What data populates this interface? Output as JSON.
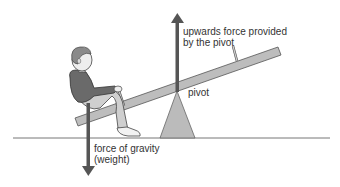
{
  "diagram": {
    "labels": {
      "upward_force_line1": "upwards force provided",
      "upward_force_line2": "by the pivot",
      "pivot": "pivot",
      "gravity_line1": "force of gravity",
      "gravity_line2": "(weight)"
    },
    "colors": {
      "arrow": "#555555",
      "plank": "#bdbdbd",
      "pivot": "#b8b8b8",
      "ground": "#666666",
      "shirt": "#6a6a6a",
      "trousers": "#cfcfcf",
      "hair": "#8a8a8a",
      "skin": "#eeeeee"
    }
  }
}
